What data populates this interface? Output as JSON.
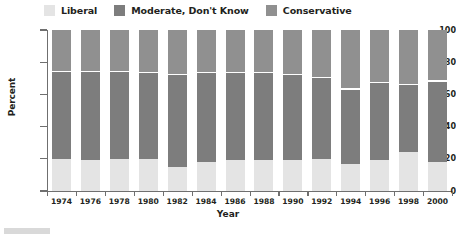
{
  "chart_data": {
    "type": "bar",
    "stacked": true,
    "title": "",
    "xlabel": "Year",
    "ylabel": "Percent",
    "ylim": [
      0,
      100
    ],
    "yticks": [
      0,
      20,
      40,
      60,
      80,
      100
    ],
    "grid": false,
    "legend_position": "top-left",
    "categories": [
      "1974",
      "1976",
      "1978",
      "1980",
      "1982",
      "1984",
      "1986",
      "1988",
      "1990",
      "1992",
      "1994",
      "1996",
      "1998",
      "2000"
    ],
    "series": [
      {
        "name": "Liberal",
        "color": "#e4e4e4",
        "values": [
          20,
          19,
          20,
          20,
          15,
          18,
          19,
          19,
          19,
          20,
          17,
          19,
          24,
          18
        ]
      },
      {
        "name": "Moderate, Don't Know",
        "color": "#7d7d7d",
        "values": [
          54,
          55,
          54,
          53,
          57,
          55,
          54,
          54,
          53,
          50,
          46,
          48,
          42,
          50
        ]
      },
      {
        "name": "Conservative",
        "color": "#909090",
        "values": [
          26,
          26,
          26,
          27,
          28,
          27,
          27,
          27,
          28,
          30,
          37,
          33,
          34,
          32
        ]
      }
    ],
    "cumulative_boundaries": [
      74,
      74,
      74,
      73,
      72,
      73,
      73,
      73,
      72,
      70,
      63,
      67,
      66,
      68
    ]
  },
  "legend": {
    "items": [
      {
        "label": "Liberal",
        "color": "#e4e4e4"
      },
      {
        "label": "Moderate, Don't Know",
        "color": "#7d7d7d"
      },
      {
        "label": "Conservative",
        "color": "#909090"
      }
    ]
  },
  "axes": {
    "y": {
      "title": "Percent",
      "ticks": [
        "0",
        "20",
        "40",
        "60",
        "80",
        "100"
      ]
    },
    "x": {
      "title": "Year",
      "ticks": [
        "1974",
        "1976",
        "1978",
        "1980",
        "1982",
        "1984",
        "1986",
        "1988",
        "1990",
        "1992",
        "1994",
        "1996",
        "1998",
        "2000"
      ]
    }
  }
}
